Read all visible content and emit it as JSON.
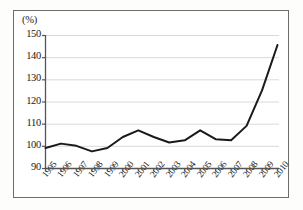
{
  "chart_data": {
    "type": "line",
    "title": "",
    "subtitle": "",
    "xlabel": "",
    "ylabel": "",
    "unit_label": "(%)",
    "categories": [
      "1995",
      "1996",
      "1997",
      "1998",
      "1999",
      "2000",
      "2001",
      "2002",
      "2003",
      "2004",
      "2005",
      "2006",
      "2007",
      "2008",
      "2009",
      "2010"
    ],
    "values": [
      99,
      101,
      100,
      97.5,
      99,
      104,
      107,
      104,
      101.5,
      102.5,
      107,
      103,
      102.5,
      109,
      125,
      145.5
    ],
    "series": [
      {
        "name": "index",
        "values": [
          99,
          101,
          100,
          97.5,
          99,
          104,
          107,
          104,
          101.5,
          102.5,
          107,
          103,
          102.5,
          109,
          125,
          145.5
        ],
        "color": "#1a1a1a"
      }
    ],
    "ylim": [
      90,
      150
    ],
    "yticks": [
      90,
      100,
      110,
      120,
      130,
      140,
      150
    ],
    "ytick_labels": [
      "90",
      "100",
      "110",
      "120",
      "130",
      "140",
      "150"
    ],
    "xlim": [
      "1995",
      "2010"
    ],
    "grid": true,
    "grid_axis": "y",
    "grid_color": "#d9d9d9",
    "legend": false,
    "legend_position": "none",
    "axis_color": "#555555",
    "line_color": "#1a1a1a",
    "line_width": 2.0,
    "background_color": "#ffffff",
    "frame_color": "#6d6d6d"
  }
}
